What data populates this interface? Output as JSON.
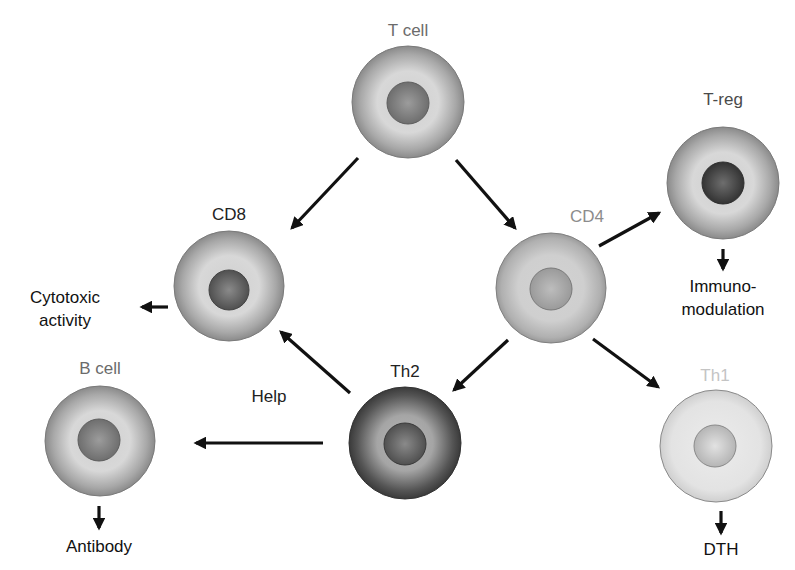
{
  "cells": [
    {
      "id": "t-cell",
      "label": "T cell",
      "label_color": "#6b6b6b",
      "shade": "medium",
      "nucleus_shade": "medium"
    },
    {
      "id": "cd8",
      "label": "CD8",
      "label_color": "#222222",
      "shade": "medium",
      "nucleus_shade": "dark"
    },
    {
      "id": "cd4",
      "label": "CD4",
      "label_color": "#8c8c8c",
      "shade": "light-medium",
      "nucleus_shade": "light-medium"
    },
    {
      "id": "t-reg",
      "label": "T-reg",
      "label_color": "#4a4a4a",
      "shade": "medium",
      "nucleus_shade": "very-dark"
    },
    {
      "id": "b-cell",
      "label": "B cell",
      "label_color": "#6b6b6b",
      "shade": "medium",
      "nucleus_shade": "medium"
    },
    {
      "id": "th2",
      "label": "Th2",
      "label_color": "#222222",
      "shade": "dark",
      "nucleus_shade": "dark"
    },
    {
      "id": "th1",
      "label": "Th1",
      "label_color": "#c4c4c4",
      "shade": "very-light",
      "nucleus_shade": "light"
    }
  ],
  "outcomes": {
    "cytotoxic_line1": "Cytotoxic",
    "cytotoxic_line2": "activity",
    "immuno_line1": "Immuno-",
    "immuno_line2": "modulation",
    "antibody": "Antibody",
    "dth": "DTH",
    "help": "Help"
  },
  "edges": [
    {
      "from": "t-cell",
      "to": "cd8"
    },
    {
      "from": "t-cell",
      "to": "cd4"
    },
    {
      "from": "cd4",
      "to": "t-reg"
    },
    {
      "from": "cd4",
      "to": "th2"
    },
    {
      "from": "cd4",
      "to": "th1"
    },
    {
      "from": "th2",
      "to": "cd8"
    },
    {
      "from": "th2",
      "to": "b-cell",
      "label": "Help"
    },
    {
      "from": "cd8",
      "to": "Cytotoxic activity"
    },
    {
      "from": "t-reg",
      "to": "Immunomodulation"
    },
    {
      "from": "b-cell",
      "to": "Antibody"
    },
    {
      "from": "th1",
      "to": "DTH"
    }
  ]
}
